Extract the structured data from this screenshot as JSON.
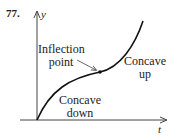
{
  "problem_number": "77.",
  "axes": {
    "y_label": "y",
    "x_label": "t"
  },
  "annotations": {
    "inflection": [
      "Inflection",
      "point"
    ],
    "concave_up": [
      "Concave",
      "up"
    ],
    "concave_down": [
      "Concave",
      "down"
    ]
  },
  "colors": {
    "stroke": "#222222",
    "background": "#ffffff"
  }
}
